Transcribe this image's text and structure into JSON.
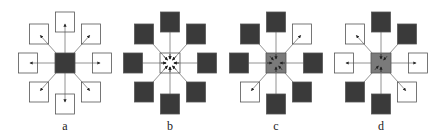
{
  "figure": {
    "colors": {
      "dark": "#3a3a3a",
      "gray": "#7a7a7a",
      "white": "#ffffff",
      "stroke": "#555555",
      "line": "#777777"
    },
    "panels": [
      {
        "label": "a",
        "cx": 65,
        "center": "dark",
        "neighbors": {
          "top": "white",
          "top_right": "white",
          "right": "white",
          "bottom_right": "white",
          "bottom": "white",
          "bottom_left": "white",
          "left": "white",
          "top_left": "white"
        }
      },
      {
        "label": "b",
        "cx": 170,
        "center": "white",
        "neighbors": {
          "top": "dark",
          "top_right": "dark",
          "right": "dark",
          "bottom_right": "dark",
          "bottom": "dark",
          "bottom_left": "dark",
          "left": "dark",
          "top_left": "dark"
        }
      },
      {
        "label": "c",
        "cx": 276,
        "center": "gray",
        "neighbors": {
          "top": "dark",
          "top_right": "white",
          "right": "dark",
          "bottom_right": "dark",
          "bottom": "dark",
          "bottom_left": "white",
          "left": "dark",
          "top_left": "dark"
        }
      },
      {
        "label": "d",
        "cx": 381,
        "center": "gray",
        "neighbors": {
          "top": "dark",
          "top_right": "dark",
          "right": "white",
          "bottom_right": "white",
          "bottom": "dark",
          "bottom_left": "dark",
          "left": "white",
          "top_left": "white"
        }
      }
    ]
  }
}
